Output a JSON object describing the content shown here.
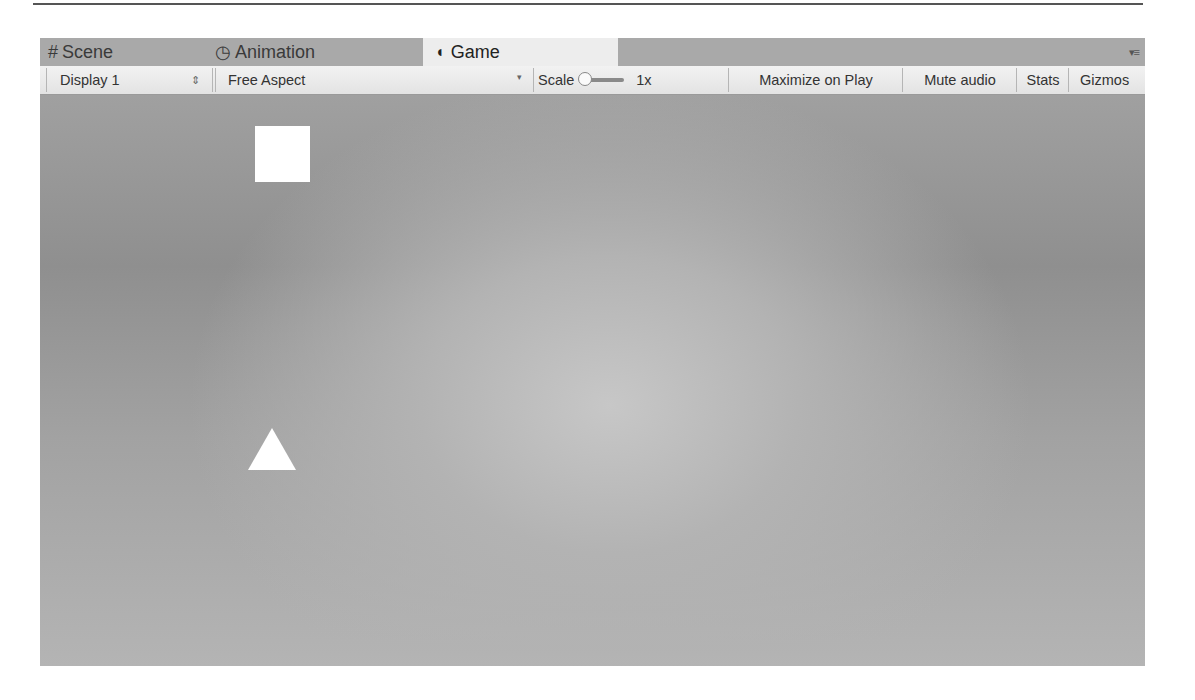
{
  "tabs": [
    {
      "label": "Scene",
      "icon": "#",
      "active": false
    },
    {
      "label": "Animation",
      "icon": "◷",
      "active": false
    },
    {
      "label": "Game",
      "icon": "◖",
      "active": true
    }
  ],
  "panel_menu_icon": "▾≡",
  "toolbar": {
    "display": {
      "value": "Display 1",
      "arrows": "⇕"
    },
    "aspect": {
      "value": "Free Aspect",
      "arrow": "▾"
    },
    "scale": {
      "label": "Scale",
      "value": "1x"
    },
    "maximize_on_play": "Maximize on Play",
    "mute_audio": "Mute audio",
    "stats": "Stats",
    "gizmos": "Gizmos"
  },
  "viewport": {
    "objects": [
      {
        "type": "square",
        "color": "#ffffff"
      },
      {
        "type": "triangle",
        "color": "#ffffff"
      }
    ]
  }
}
